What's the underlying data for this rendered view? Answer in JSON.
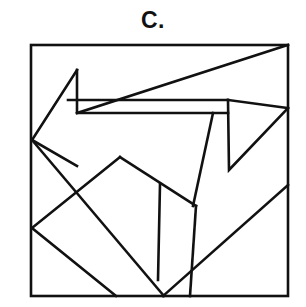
{
  "figure": {
    "label": "C.",
    "caption_position": "top-center",
    "background_color": "#ffffff",
    "stroke_color": "#111111",
    "frame": {
      "x": 31,
      "y": 45,
      "width": 257,
      "height": 251,
      "stroke_width": 2.6
    },
    "line_stroke_width": 2.6,
    "shapes": [
      {
        "name": "left-arrow-band",
        "type": "polyline",
        "points": [
          [
            77,
            70
          ],
          [
            32,
            140
          ],
          [
            77,
            166
          ]
        ],
        "closed": false
      },
      {
        "name": "arrow-inner-notch",
        "type": "polyline",
        "points": [
          [
            77,
            70
          ],
          [
            77,
            113
          ],
          [
            228,
            113
          ]
        ],
        "closed": false
      },
      {
        "name": "long-horizontal-rule",
        "type": "polyline",
        "points": [
          [
            68,
            100
          ],
          [
            228,
            100
          ]
        ],
        "closed": false
      },
      {
        "name": "lower-band-edge",
        "type": "polyline",
        "points": [
          [
            77,
            113
          ],
          [
            288,
            45
          ]
        ],
        "closed": false
      },
      {
        "name": "right-peak-upper",
        "type": "polyline",
        "points": [
          [
            228,
            100
          ],
          [
            288,
            108
          ]
        ],
        "closed": false
      },
      {
        "name": "right-zigzag",
        "type": "polyline",
        "points": [
          [
            228,
            100
          ],
          [
            229,
            170
          ],
          [
            288,
            108
          ]
        ],
        "closed": false
      },
      {
        "name": "beak-diagonal",
        "type": "polyline",
        "points": [
          [
            213,
            113
          ],
          [
            193,
            206
          ]
        ],
        "closed": false
      },
      {
        "name": "lower-vertical-tail",
        "type": "polyline",
        "points": [
          [
            196,
            206
          ],
          [
            190,
            296
          ]
        ],
        "closed": false
      },
      {
        "name": "right-lower-diagonal",
        "type": "polyline",
        "points": [
          [
            288,
            185
          ],
          [
            163,
            296
          ]
        ],
        "closed": false
      },
      {
        "name": "mid-left-diagonal",
        "type": "polyline",
        "points": [
          [
            32,
            140
          ],
          [
            164,
            296
          ]
        ],
        "closed": false
      },
      {
        "name": "house-roof-left",
        "type": "polyline",
        "points": [
          [
            32,
            228
          ],
          [
            120,
            157
          ]
        ],
        "closed": false
      },
      {
        "name": "house-roof-right",
        "type": "polyline",
        "points": [
          [
            120,
            157
          ],
          [
            196,
            206
          ]
        ],
        "closed": false
      },
      {
        "name": "house-left-wall",
        "type": "polyline",
        "points": [
          [
            32,
            228
          ],
          [
            116,
            296
          ]
        ],
        "closed": false
      },
      {
        "name": "house-inner-vertical",
        "type": "polyline",
        "points": [
          [
            160,
            184
          ],
          [
            158,
            280
          ]
        ],
        "closed": false
      }
    ]
  }
}
